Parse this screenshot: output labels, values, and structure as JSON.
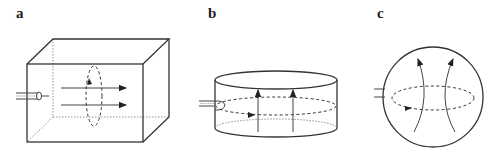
{
  "panels": [
    {
      "label": "a",
      "shape": "rectangular-box",
      "flow_direction": "horizontal"
    },
    {
      "label": "b",
      "shape": "cylinder",
      "flow_direction": "vertical"
    },
    {
      "label": "c",
      "shape": "sphere",
      "flow_direction": "vertical-diverging"
    }
  ],
  "colors": {
    "stroke": "#333333",
    "background": "#ffffff"
  }
}
